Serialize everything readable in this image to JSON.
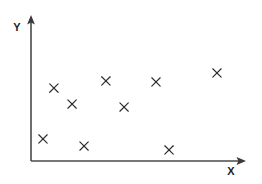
{
  "chart_data": {
    "type": "scatter",
    "title": "",
    "xlabel": "X",
    "ylabel": "Y",
    "xlim": [
      0,
      100
    ],
    "ylim": [
      0,
      100
    ],
    "grid": false,
    "legend": null,
    "marker": "x",
    "marker_color": "#2b2b2b",
    "series": [
      {
        "name": "data",
        "points": [
          {
            "x": 10.7,
            "y": 50.3
          },
          {
            "x": 19.2,
            "y": 39.3
          },
          {
            "x": 5.6,
            "y": 15.2
          },
          {
            "x": 24.8,
            "y": 10.3
          },
          {
            "x": 35.0,
            "y": 55.2
          },
          {
            "x": 43.5,
            "y": 37.2
          },
          {
            "x": 58.4,
            "y": 54.5
          },
          {
            "x": 64.5,
            "y": 7.6
          },
          {
            "x": 86.9,
            "y": 60.7
          }
        ]
      }
    ]
  },
  "axes": {
    "x_axis_name": "x-axis",
    "y_axis_name": "y-axis",
    "x_label_text": "X",
    "y_label_text": "Y",
    "origin_px": [
      31,
      161
    ],
    "x_end_px": [
      245,
      161
    ],
    "y_end_px": [
      31,
      16
    ],
    "axis_color": "#4a4a4a",
    "arrow_color": "#3a3a3a"
  },
  "geometry": {
    "width": 262,
    "height": 184,
    "plot_left_px": 31,
    "plot_bottom_px": 161,
    "plot_span_x_px": 214,
    "plot_span_y_px": 145,
    "marker_half_size_px": 4.2
  }
}
